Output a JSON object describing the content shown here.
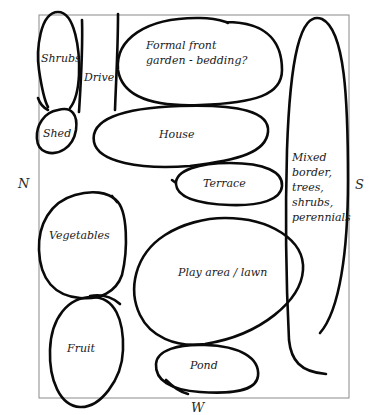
{
  "diagram": {
    "type": "garden-layout-sketch",
    "compass": {
      "north": "N",
      "south": "S",
      "west": "W"
    },
    "zones": [
      {
        "id": "shrubs",
        "label": "Shrubs"
      },
      {
        "id": "drive",
        "label": "Drive"
      },
      {
        "id": "formal-front-garden",
        "label_line1": "Formal front",
        "label_line2": "garden - bedding?"
      },
      {
        "id": "shed",
        "label": "Shed"
      },
      {
        "id": "house",
        "label": "House"
      },
      {
        "id": "terrace",
        "label": "Terrace"
      },
      {
        "id": "mixed-border",
        "label_lines": [
          "Mixed",
          "border,",
          "trees,",
          "shrubs,",
          "perennials"
        ]
      },
      {
        "id": "vegetables",
        "label": "Vegetables"
      },
      {
        "id": "play-area-lawn",
        "label": "Play area / lawn"
      },
      {
        "id": "fruit",
        "label": "Fruit"
      },
      {
        "id": "pond",
        "label": "Pond"
      }
    ],
    "colors": {
      "ink": "#0a0a0a",
      "boundary": "#8a8a8a",
      "background": "#ffffff"
    }
  }
}
